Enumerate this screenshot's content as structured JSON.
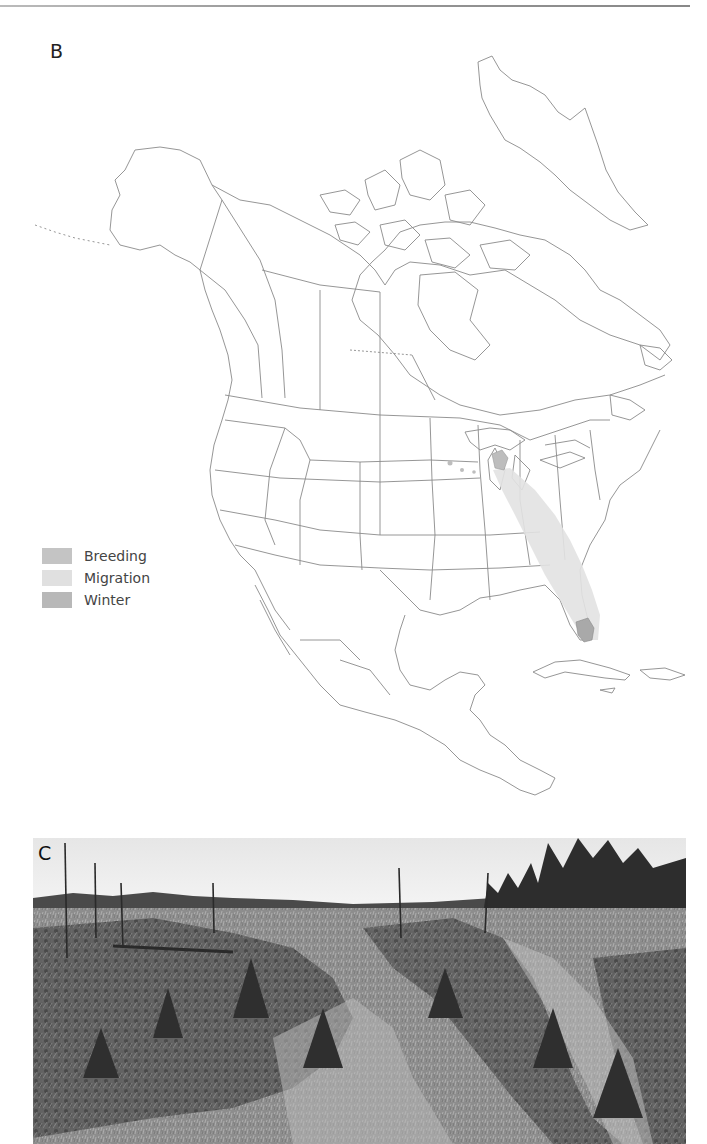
{
  "figure": {
    "panel_b_label": "B",
    "panel_c_label": "C",
    "map": {
      "title": "",
      "region": "North America",
      "legend": [
        {
          "label": "Breeding",
          "color": "#c4c4c4"
        },
        {
          "label": "Migration",
          "color": "#e0e0e0"
        },
        {
          "label": "Winter",
          "color": "#b8b8b8"
        }
      ],
      "colors": {
        "outline": "#8a8a8a",
        "background": "#ffffff",
        "breeding": "#bdbdbd",
        "migration": "#e2e2e2",
        "winter": "#a9a9a9"
      }
    },
    "photo": {
      "description": "Black-and-white photograph of young jack pine stand with scattered dead snags and taller pines at right"
    }
  }
}
